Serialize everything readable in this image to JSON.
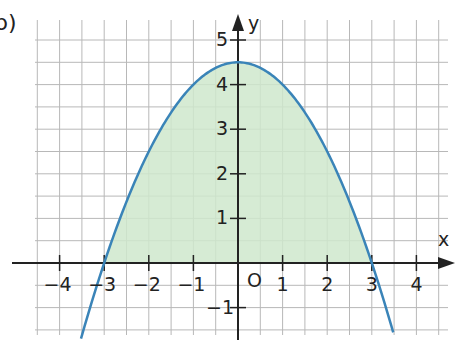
{
  "part_label": "b)",
  "chart_data": {
    "type": "area",
    "title": "",
    "function": "y = -0.5x^2 + 4.5",
    "xlabel": "x",
    "ylabel": "y",
    "xlim": [
      -5.2,
      4.5
    ],
    "ylim": [
      -1.7,
      5.5
    ],
    "grid": true,
    "grid_step": 0.5,
    "x_ticks": [
      -4,
      -3,
      -2,
      -1,
      1,
      2,
      3,
      4
    ],
    "x_tick_labels": [
      "−4",
      "−3",
      "−2",
      "−1",
      "1",
      "2",
      "3",
      "4"
    ],
    "y_ticks": [
      -1,
      1,
      2,
      3,
      4,
      5
    ],
    "y_tick_labels": [
      "−1",
      "1",
      "2",
      "3",
      "4",
      "5"
    ],
    "origin_label": "O",
    "vertex": [
      0,
      4.5
    ],
    "roots": [
      -3,
      3
    ],
    "shaded_region": {
      "from": -3,
      "to": 3,
      "between": "curve and x-axis"
    },
    "x": [
      -3.5,
      -3,
      -2.5,
      -2,
      -1.5,
      -1,
      -0.5,
      0,
      0.5,
      1,
      1.5,
      2,
      2.5,
      3,
      3.5
    ],
    "values": [
      -1.625,
      0,
      1.375,
      2.5,
      3.375,
      4,
      4.375,
      4.5,
      4.375,
      4,
      3.375,
      2.5,
      1.375,
      0,
      -1.625
    ],
    "colors": {
      "curve": "#3a84b8",
      "fill": "#cfe8cc",
      "grid": "#b8b8b8",
      "axis": "#222222"
    }
  }
}
